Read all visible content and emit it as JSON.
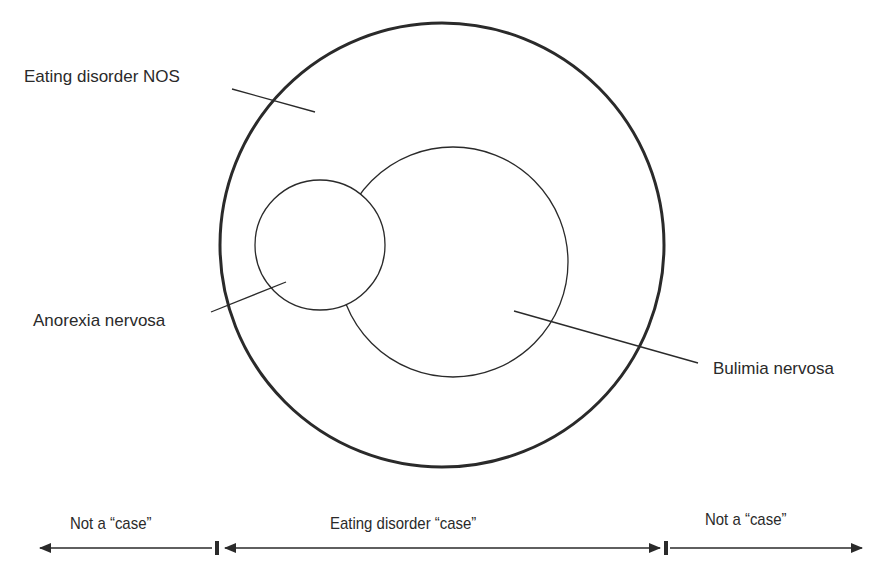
{
  "diagram": {
    "labels": {
      "nos": "Eating disorder NOS",
      "anorexia": "Anorexia nervosa",
      "bulimia": "Bulimia nervosa"
    },
    "circles": {
      "outer": {
        "cx": 442,
        "cy": 245,
        "r": 222,
        "stroke_width": 3,
        "represents": "Eating disorder NOS"
      },
      "bulimia": {
        "cx": 453,
        "cy": 262,
        "r": 115,
        "stroke_width": 1.3,
        "represents": "Bulimia nervosa"
      },
      "anorexia": {
        "cx": 320,
        "cy": 245,
        "r": 65,
        "stroke_width": 1.3,
        "represents": "Anorexia nervosa"
      }
    },
    "axis": {
      "left_label": "Not a “case”",
      "center_label": "Eating disorder “case”",
      "right_label": "Not a “case”"
    },
    "colors": {
      "stroke": "#2a2a2a",
      "background": "#ffffff"
    }
  }
}
